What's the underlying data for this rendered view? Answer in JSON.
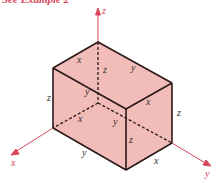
{
  "header": {
    "text": "See Example 2"
  },
  "colors": {
    "axis": "#d9465a",
    "box_fill": "#f2bcb8",
    "edge": "#2a1a1a",
    "header": "#d9465a"
  },
  "axes": {
    "x_label": "x",
    "y_label": "y",
    "z_label": "z"
  },
  "edge_labels": {
    "top_back_left": "x",
    "top_back_right": "y",
    "back_vertical": "z",
    "left_vertical": "z",
    "top_front_left": "y",
    "top_front_right": "x",
    "right_vertical": "z",
    "bottom_hidden_x": "x",
    "bottom_hidden_y": "y",
    "front_vertical": "z",
    "bottom_front_left": "y",
    "bottom_front_right": "x"
  }
}
